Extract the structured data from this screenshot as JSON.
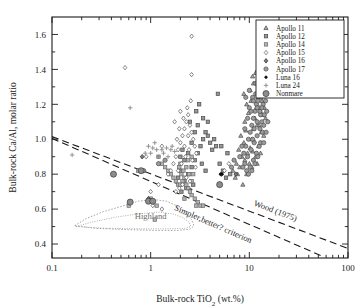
{
  "chart_data": {
    "type": "scatter",
    "title": "",
    "xlabel": "Bulk-rock TiO2 (wt.%)",
    "xlabel_main": "Bulk-rock TiO",
    "xlabel_sub": "2",
    "xlabel_tail": " (wt.%)",
    "ylabel": "Bulk-rock Ca/Al, molar ratio",
    "xscale": "log",
    "yscale": "linear",
    "xlim": [
      0.1,
      100
    ],
    "ylim": [
      0.32,
      1.7
    ],
    "xticks": [
      "0.1",
      "1",
      "10",
      "100"
    ],
    "xtick_values": [
      0.1,
      1,
      10,
      100
    ],
    "yticks": [
      "0.4",
      "0.6",
      "0.8",
      "1.0",
      "1.2",
      "1.4",
      "1.6"
    ],
    "ytick_values": [
      0.4,
      0.6,
      0.8,
      1.0,
      1.2,
      1.4,
      1.6
    ],
    "yminor_step": 0.1,
    "grid": false,
    "legend_position": "top-right",
    "legend_border": true,
    "series": [
      {
        "name": "Apollo 11",
        "marker": "triangle",
        "fill": "#a8a8a8",
        "stroke": "#4a4a4a",
        "size": 4.2,
        "points": [
          [
            9.0,
            0.88
          ],
          [
            9.6,
            0.92
          ],
          [
            10.2,
            0.95
          ],
          [
            10.6,
            1.0
          ],
          [
            11.0,
            1.06
          ],
          [
            11.4,
            1.12
          ],
          [
            11.8,
            1.18
          ],
          [
            12.2,
            1.24
          ],
          [
            12.6,
            1.3
          ],
          [
            13.0,
            1.34
          ],
          [
            12.2,
            1.4
          ],
          [
            11.6,
            1.38
          ],
          [
            10.4,
            1.22
          ],
          [
            9.8,
            1.15
          ],
          [
            9.2,
            1.05
          ],
          [
            8.8,
            0.98
          ],
          [
            8.4,
            0.9
          ],
          [
            8.0,
            0.84
          ],
          [
            7.6,
            0.8
          ],
          [
            7.2,
            0.78
          ],
          [
            8.6,
            0.74
          ],
          [
            9.4,
            0.8
          ],
          [
            10.0,
            0.86
          ],
          [
            10.8,
            0.93
          ],
          [
            11.2,
            0.99
          ],
          [
            12.0,
            1.08
          ],
          [
            12.8,
            1.16
          ],
          [
            13.4,
            1.22
          ],
          [
            13.8,
            1.27
          ],
          [
            14.2,
            1.18
          ],
          [
            14.6,
            1.12
          ],
          [
            13.2,
            1.04
          ],
          [
            12.4,
            0.96
          ],
          [
            11.6,
            0.9
          ],
          [
            10.6,
            0.84
          ],
          [
            9.0,
            1.1
          ],
          [
            9.4,
            1.2
          ],
          [
            10.2,
            1.28
          ],
          [
            11.0,
            1.32
          ],
          [
            12.6,
            1.08
          ],
          [
            13.6,
            1.14
          ],
          [
            8.2,
            1.02
          ],
          [
            7.8,
            0.94
          ],
          [
            8.8,
            1.26
          ],
          [
            10.8,
            1.36
          ],
          [
            6.8,
            0.82
          ],
          [
            7.4,
            0.86
          ],
          [
            14.0,
            1.02
          ],
          [
            13.0,
            0.92
          ],
          [
            12.0,
            0.86
          ]
        ]
      },
      {
        "name": "Apollo 12",
        "marker": "square",
        "fill": "#969696",
        "stroke": "#4a4a4a",
        "size": 4.0,
        "points": [
          [
            2.2,
            0.76
          ],
          [
            2.4,
            0.8
          ],
          [
            2.6,
            0.84
          ],
          [
            2.8,
            0.88
          ],
          [
            3.0,
            0.92
          ],
          [
            3.2,
            0.96
          ],
          [
            3.4,
            1.0
          ],
          [
            3.6,
            1.04
          ],
          [
            3.8,
            1.02
          ],
          [
            4.0,
            0.98
          ],
          [
            4.2,
            0.94
          ],
          [
            3.0,
            1.08
          ],
          [
            2.8,
            1.04
          ],
          [
            2.6,
            0.98
          ],
          [
            2.4,
            0.92
          ],
          [
            2.2,
            0.88
          ],
          [
            2.0,
            0.82
          ],
          [
            1.9,
            0.78
          ],
          [
            3.4,
            1.12
          ],
          [
            3.8,
            1.1
          ],
          [
            4.4,
            1.0
          ],
          [
            4.6,
            0.96
          ],
          [
            2.9,
            1.16
          ],
          [
            3.1,
            1.2
          ],
          [
            4.8,
            1.26
          ],
          [
            2.5,
            1.1
          ],
          [
            2.1,
            0.94
          ],
          [
            2.0,
            0.9
          ],
          [
            5.0,
            0.86
          ],
          [
            5.4,
            0.82
          ],
          [
            5.8,
            0.78
          ],
          [
            3.3,
            0.86
          ],
          [
            3.6,
            0.82
          ],
          [
            2.7,
            0.74
          ],
          [
            2.3,
            0.72
          ],
          [
            2.05,
            0.7
          ],
          [
            6.4,
            0.8
          ],
          [
            6.0,
            0.92
          ],
          [
            5.2,
            0.96
          ]
        ]
      },
      {
        "name": "Apollo 14",
        "marker": "square",
        "fill": "#b4b4b4",
        "stroke": "#6a6a6a",
        "size": 4.0,
        "points": [
          [
            1.7,
            0.78
          ],
          [
            1.8,
            0.76
          ],
          [
            1.9,
            0.74
          ],
          [
            2.0,
            0.74
          ],
          [
            2.1,
            0.76
          ],
          [
            2.2,
            0.78
          ],
          [
            2.3,
            0.74
          ],
          [
            2.4,
            0.72
          ],
          [
            2.5,
            0.7
          ],
          [
            2.6,
            0.68
          ],
          [
            2.8,
            0.66
          ],
          [
            3.0,
            0.64
          ],
          [
            3.2,
            0.62
          ],
          [
            3.4,
            0.62
          ],
          [
            1.6,
            0.8
          ],
          [
            1.5,
            0.82
          ],
          [
            1.4,
            0.84
          ],
          [
            1.3,
            0.86
          ],
          [
            2.05,
            0.8
          ],
          [
            2.15,
            0.82
          ],
          [
            1.95,
            0.84
          ],
          [
            2.3,
            0.84
          ],
          [
            2.45,
            0.8
          ],
          [
            2.2,
            0.66
          ],
          [
            1.1,
            0.54
          ],
          [
            2.9,
            0.62
          ],
          [
            2.6,
            0.76
          ],
          [
            2.7,
            0.8
          ],
          [
            1.0,
            0.66
          ],
          [
            0.75,
            0.82
          ],
          [
            0.6,
            0.62
          ],
          [
            1.15,
            0.62
          ],
          [
            2.4,
            0.88
          ],
          [
            2.0,
            0.86
          ],
          [
            2.6,
            0.9
          ],
          [
            1.2,
            0.9
          ]
        ]
      },
      {
        "name": "Apollo 15",
        "marker": "diamond-open",
        "fill": "#ffffff",
        "stroke": "#555555",
        "size": 4.4,
        "points": [
          [
            1.8,
            0.9
          ],
          [
            1.9,
            0.94
          ],
          [
            2.0,
            0.98
          ],
          [
            2.1,
            1.02
          ],
          [
            2.2,
            1.06
          ],
          [
            2.3,
            1.1
          ],
          [
            2.4,
            1.14
          ],
          [
            2.5,
            1.08
          ],
          [
            2.6,
            1.04
          ],
          [
            2.7,
            1.0
          ],
          [
            2.8,
            0.96
          ],
          [
            2.9,
            0.92
          ],
          [
            1.7,
            0.86
          ],
          [
            1.6,
            0.82
          ],
          [
            1.5,
            0.8
          ],
          [
            2.05,
            0.86
          ],
          [
            2.25,
            0.9
          ],
          [
            2.45,
            0.94
          ],
          [
            2.65,
            0.88
          ],
          [
            2.85,
            0.84
          ],
          [
            1.85,
            1.0
          ],
          [
            1.95,
            1.06
          ],
          [
            2.15,
            1.12
          ],
          [
            2.35,
            1.18
          ],
          [
            2.55,
            1.22
          ],
          [
            2.0,
            1.16
          ],
          [
            1.75,
            1.1
          ],
          [
            2.3,
            0.78
          ],
          [
            2.5,
            0.76
          ],
          [
            2.1,
            0.74
          ],
          [
            1.95,
            0.72
          ],
          [
            1.8,
            0.7
          ],
          [
            1.0,
            0.7
          ],
          [
            1.2,
            0.74
          ],
          [
            0.9,
            0.9
          ],
          [
            1.3,
            0.96
          ],
          [
            2.6,
            1.37
          ],
          [
            2.6,
            1.59
          ],
          [
            0.55,
            1.41
          ],
          [
            5.6,
            0.82
          ],
          [
            6.2,
            0.86
          ],
          [
            2.4,
            1.02
          ],
          [
            2.2,
            0.96
          ],
          [
            1.9,
            0.82
          ],
          [
            1.05,
            0.62
          ],
          [
            1.3,
            0.6
          ]
        ]
      },
      {
        "name": "Apollo 16",
        "marker": "diamond-filled",
        "fill": "#787878",
        "stroke": "#2e2e2e",
        "size": 4.6,
        "points": [
          [
            0.82,
            0.9
          ],
          [
            5.2,
            0.8
          ],
          [
            7.3,
            0.8
          ],
          [
            0.95,
            0.66
          ],
          [
            1.0,
            0.65
          ]
        ]
      },
      {
        "name": "Apollo 17",
        "marker": "circle",
        "fill": "#9c9c9c",
        "stroke": "#4a4a4a",
        "size": 4.6,
        "points": [
          [
            9.2,
            0.96
          ],
          [
            9.8,
            1.0
          ],
          [
            10.2,
            1.04
          ],
          [
            10.6,
            1.08
          ],
          [
            11.0,
            1.12
          ],
          [
            11.4,
            1.16
          ],
          [
            11.8,
            1.2
          ],
          [
            12.2,
            1.22
          ],
          [
            12.6,
            1.18
          ],
          [
            13.0,
            1.14
          ],
          [
            13.4,
            1.1
          ],
          [
            12.8,
            1.06
          ],
          [
            12.0,
            1.02
          ],
          [
            11.2,
            0.98
          ],
          [
            10.4,
            0.94
          ],
          [
            9.6,
            0.9
          ],
          [
            9.0,
            0.86
          ],
          [
            8.6,
            0.84
          ],
          [
            10.0,
            1.18
          ],
          [
            10.8,
            1.24
          ],
          [
            11.6,
            1.26
          ],
          [
            12.4,
            1.28
          ],
          [
            13.2,
            1.24
          ],
          [
            13.8,
            1.2
          ],
          [
            14.2,
            1.14
          ],
          [
            13.6,
            1.04
          ],
          [
            12.6,
            0.96
          ],
          [
            11.8,
            0.92
          ],
          [
            11.0,
            0.88
          ],
          [
            10.2,
            0.84
          ],
          [
            9.4,
            0.82
          ],
          [
            9.0,
            1.06
          ],
          [
            9.6,
            1.12
          ],
          [
            10.4,
            1.16
          ],
          [
            11.2,
            1.06
          ],
          [
            12.0,
            1.1
          ],
          [
            12.8,
            1.16
          ],
          [
            13.4,
            1.18
          ],
          [
            14.0,
            1.08
          ],
          [
            13.0,
            0.98
          ],
          [
            12.2,
            0.9
          ],
          [
            11.4,
            0.86
          ],
          [
            10.6,
            0.82
          ],
          [
            9.8,
            0.8
          ],
          [
            8.8,
            0.92
          ],
          [
            14.6,
            1.22
          ],
          [
            15.0,
            1.16
          ],
          [
            15.4,
            1.1
          ],
          [
            14.8,
            1.04
          ],
          [
            14.0,
            0.98
          ],
          [
            8.4,
            0.96
          ],
          [
            8.0,
            0.9
          ],
          [
            9.2,
            1.24
          ],
          [
            10.0,
            1.28
          ],
          [
            11.6,
            1.32
          ],
          [
            12.4,
            1.34
          ],
          [
            13.2,
            1.3
          ],
          [
            10.8,
            1.0
          ],
          [
            11.0,
            1.22
          ],
          [
            12.0,
            1.18
          ],
          [
            5.0,
            0.74
          ],
          [
            1.4,
            0.88
          ],
          [
            1.2,
            0.86
          ],
          [
            0.85,
            0.82
          ],
          [
            6.6,
            0.84
          ],
          [
            7.0,
            0.88
          ]
        ]
      },
      {
        "name": "Luna 16",
        "marker": "circle-small-dark",
        "fill": "#1a1a1a",
        "stroke": "#000000",
        "size": 2.6,
        "points": [
          [
            5.1,
            0.8
          ],
          [
            5.3,
            0.8
          ]
        ]
      },
      {
        "name": "Luna 24",
        "marker": "plus",
        "fill": "none",
        "stroke": "#8a8a8a",
        "size": 4.4,
        "points": [
          [
            0.62,
            1.18
          ],
          [
            0.95,
            0.96
          ],
          [
            1.05,
            0.95
          ],
          [
            1.15,
            0.94
          ],
          [
            1.3,
            0.94
          ],
          [
            1.45,
            0.95
          ],
          [
            1.6,
            0.94
          ],
          [
            1.75,
            0.93
          ],
          [
            1.2,
            0.9
          ],
          [
            1.0,
            0.92
          ],
          [
            1.5,
            0.9
          ],
          [
            0.16,
            0.91
          ],
          [
            0.88,
            0.92
          ],
          [
            1.35,
            0.92
          ],
          [
            1.65,
            0.96
          ],
          [
            1.1,
            0.98
          ]
        ]
      },
      {
        "name": "Nonmare",
        "marker": "circle-large",
        "fill": "#8c8c8c",
        "stroke": "#3a3a3a",
        "size": 6.6,
        "points": [
          [
            0.42,
            0.8
          ],
          [
            0.8,
            0.82
          ],
          [
            0.62,
            0.64
          ],
          [
            0.95,
            0.645
          ],
          [
            1.05,
            0.645
          ],
          [
            5.0,
            0.74
          ]
        ]
      }
    ],
    "reference_lines": [
      {
        "name": "Wood (1975)",
        "label": "Wood (1975)",
        "style": "dashed",
        "p1": [
          0.1,
          1.015
        ],
        "p2": [
          100,
          0.375
        ],
        "label_x": 18,
        "label_y": 0.575
      },
      {
        "name": "Simpler, better? criterion",
        "label": "Simpler,better? criterion",
        "style": "dashed",
        "p1": [
          0.1,
          1.005
        ],
        "p2": [
          55,
          0.33
        ],
        "label_x": 4.2,
        "label_y": 0.5
      }
    ],
    "fields": [
      {
        "name": "Highland",
        "label": "Highland",
        "style": "dotted",
        "label_x": 1.0,
        "label_y": 0.545
      }
    ]
  },
  "legend": {
    "entries": [
      {
        "label": "Apollo 11",
        "marker": "triangle"
      },
      {
        "label": "Apollo 12",
        "marker": "square"
      },
      {
        "label": "Apollo 14",
        "marker": "square"
      },
      {
        "label": "Apollo 15",
        "marker": "diamond-open"
      },
      {
        "label": "Apollo 16",
        "marker": "diamond-filled"
      },
      {
        "label": "Apollo 17",
        "marker": "circle"
      },
      {
        "label": "Luna 16",
        "marker": "circle-small-dark"
      },
      {
        "label": "Luna 24",
        "marker": "plus"
      },
      {
        "label": "Nonmare",
        "marker": "circle-large"
      }
    ]
  },
  "colors": {
    "axis": "#1a1a1a",
    "background": "#ffffff",
    "annotation": "#2a2a2a",
    "field_outline": "#9a9a9a",
    "field_label": "#6d6d6d"
  }
}
